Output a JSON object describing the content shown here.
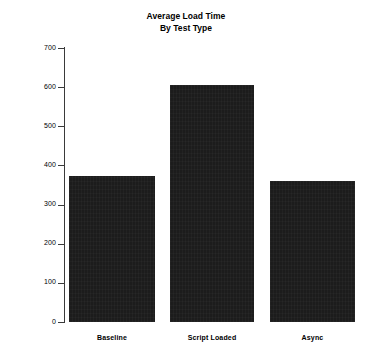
{
  "chart_data": {
    "type": "bar",
    "title": "Average Load Time By Test Type",
    "title_lines": [
      "Average Load Time",
      "By Test Type"
    ],
    "categories": [
      "Baseline",
      "Script Loaded",
      "Async"
    ],
    "values": [
      374,
      605,
      360
    ],
    "xlabel": "",
    "ylabel": "milliseconds",
    "ylim": [
      0,
      700
    ],
    "ytick_step": 100,
    "yticks": [
      0,
      100,
      200,
      300,
      400,
      500,
      600,
      700
    ],
    "ytick_labels": [
      "0",
      "100",
      "200",
      "300",
      "400",
      "500",
      "600",
      "700"
    ],
    "grid": false,
    "legend": null,
    "bar_color": "#1c1c1c",
    "axis_color": "#3a3a3a",
    "background_color": "#ffffff"
  }
}
